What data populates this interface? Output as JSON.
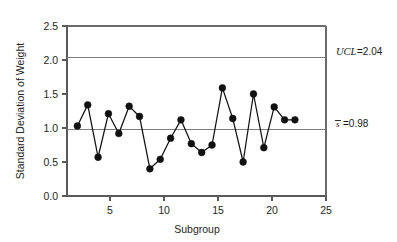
{
  "chart_data": {
    "type": "line",
    "title": "",
    "subtitle": "",
    "xlabel": "Subgroup",
    "ylabel": "Standard Deviation of Weight",
    "xlim": [
      0,
      25
    ],
    "ylim": [
      0.0,
      2.5
    ],
    "xticks": [
      5,
      10,
      15,
      20,
      25
    ],
    "xtick_labels": [
      "5",
      "10",
      "15",
      "20",
      "25"
    ],
    "yticks": [
      0.0,
      0.5,
      1.0,
      1.5,
      2.0,
      2.5
    ],
    "ytick_labels": [
      "0.0",
      "0.5",
      "1.0",
      "1.5",
      "2.0",
      "2.5"
    ],
    "grid": false,
    "legend": "none",
    "marker": "filled-circle",
    "x": [
      1,
      2,
      3,
      4,
      5,
      6,
      7,
      8,
      9,
      10,
      11,
      12,
      13,
      14,
      15,
      16,
      17,
      18,
      19,
      20,
      21,
      22
    ],
    "values": [
      1.03,
      1.34,
      0.57,
      1.21,
      0.92,
      1.32,
      1.17,
      0.4,
      0.54,
      0.85,
      1.12,
      0.77,
      0.64,
      0.75,
      1.59,
      1.14,
      0.5,
      1.5,
      0.71,
      1.31,
      1.12,
      1.12
    ],
    "series": [
      {
        "name": "Standard Deviation of Weight",
        "values": [
          1.03,
          1.34,
          0.57,
          1.21,
          0.92,
          1.32,
          1.17,
          0.4,
          0.54,
          0.85,
          1.12,
          0.77,
          0.64,
          0.75,
          1.59,
          1.14,
          0.5,
          1.5,
          0.71,
          1.31,
          1.12,
          1.12
        ]
      }
    ],
    "reference_lines": [
      {
        "id": "ucl",
        "value": 2.04,
        "label_symbol": "UCL",
        "label_value": "=2.04",
        "label_full": "UCL=2.04"
      },
      {
        "id": "center",
        "value": 0.98,
        "label_symbol": "s",
        "label_value": "=0.98",
        "label_full": "s̄=0.98"
      }
    ],
    "annotations": [
      {
        "text": "UCL=2.04"
      },
      {
        "text": "s̄=0.98"
      }
    ],
    "colors": {
      "series": "#111111",
      "reference_line": "#7d7d7d",
      "axis": "#595959",
      "background": "#ffffff"
    }
  }
}
